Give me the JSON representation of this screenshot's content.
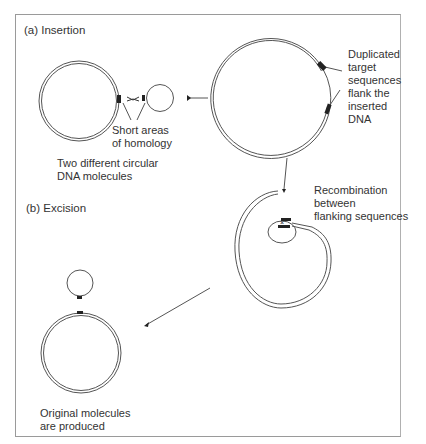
{
  "figure": {
    "sections": {
      "insertion": "(a) Insertion",
      "excision": "(b) Excision"
    },
    "labels": {
      "homology": [
        "Short areas",
        "of homology"
      ],
      "two_molecules": [
        "Two different circular",
        "DNA molecules"
      ],
      "duplicated": [
        "Duplicated",
        "target",
        "sequences",
        "flank the",
        "inserted",
        "DNA"
      ],
      "recombination": [
        "Recombination",
        "between",
        "flanking sequences"
      ],
      "original": [
        "Original molecules",
        "are produced"
      ]
    },
    "colors": {
      "line": "#555555",
      "marker": "#222222",
      "frame": "#9a9a9a"
    }
  }
}
